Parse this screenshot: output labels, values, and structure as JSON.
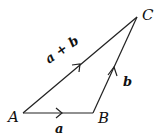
{
  "diagram": {
    "type": "vector-triangle",
    "points": [
      {
        "id": "A",
        "label": "A",
        "x": 23,
        "y": 113
      },
      {
        "id": "B",
        "label": "B",
        "x": 93,
        "y": 113
      },
      {
        "id": "C",
        "label": "C",
        "x": 137,
        "y": 17
      }
    ],
    "vectors": [
      {
        "from": "A",
        "to": "B",
        "label": "a"
      },
      {
        "from": "B",
        "to": "C",
        "label": "b"
      },
      {
        "from": "A",
        "to": "C",
        "label": "a + b"
      }
    ],
    "colors": {
      "stroke": "#222222",
      "text": "#111111",
      "background": "#ffffff"
    }
  }
}
